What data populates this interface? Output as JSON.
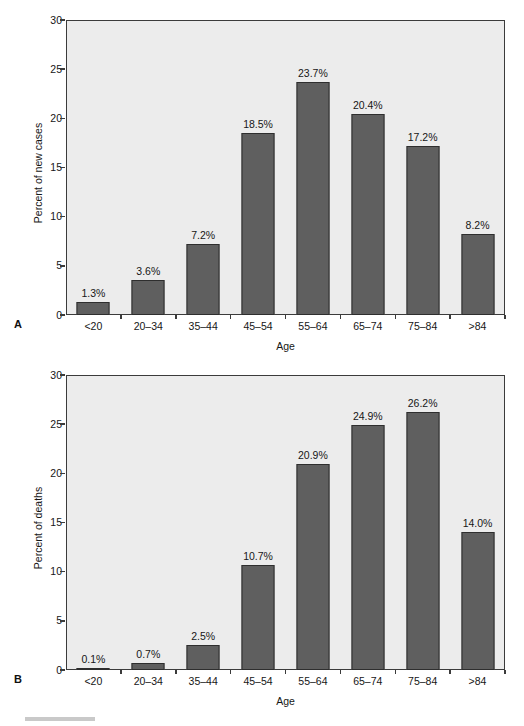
{
  "page": {
    "background": "#ffffff",
    "bar_color": "#5f5f5f",
    "plot_background": "#ececec",
    "axis_color": "#3b3b3b"
  },
  "panels": [
    {
      "letter": "A",
      "ylabel": "Percent of new cases",
      "xlabel": "Age",
      "yticks": [
        "0",
        "5",
        "10",
        "15",
        "20",
        "25",
        "30"
      ]
    },
    {
      "letter": "B",
      "ylabel": "Percent of deaths",
      "xlabel": "Age",
      "yticks": [
        "0",
        "5",
        "10",
        "15",
        "20",
        "25",
        "30"
      ]
    }
  ],
  "chart_data": [
    {
      "type": "bar",
      "panel": "A",
      "title": "",
      "xlabel": "Age",
      "ylabel": "Percent of new cases",
      "categories": [
        "<20",
        "20–34",
        "35–44",
        "45–54",
        "55–64",
        "65–74",
        "75–84",
        ">84"
      ],
      "values": [
        1.3,
        3.6,
        7.2,
        18.5,
        23.7,
        20.4,
        17.2,
        8.2
      ],
      "data_labels": [
        "1.3%",
        "3.6%",
        "7.2%",
        "18.5%",
        "23.7%",
        "20.4%",
        "17.2%",
        "8.2%"
      ],
      "ylim": [
        0,
        30
      ],
      "yticks": [
        0,
        5,
        10,
        15,
        20,
        25,
        30
      ],
      "ytick_labels": [
        "0",
        "5",
        "10",
        "15",
        "20",
        "25",
        "30"
      ],
      "grid": false,
      "legend": false
    },
    {
      "type": "bar",
      "panel": "B",
      "title": "",
      "xlabel": "Age",
      "ylabel": "Percent of deaths",
      "categories": [
        "<20",
        "20–34",
        "35–44",
        "45–54",
        "55–64",
        "65–74",
        "75–84",
        ">84"
      ],
      "values": [
        0.1,
        0.7,
        2.5,
        10.7,
        20.9,
        24.9,
        26.2,
        14.0
      ],
      "data_labels": [
        "0.1%",
        "0.7%",
        "2.5%",
        "10.7%",
        "20.9%",
        "24.9%",
        "26.2%",
        "14.0%"
      ],
      "ylim": [
        0,
        30
      ],
      "yticks": [
        0,
        5,
        10,
        15,
        20,
        25,
        30
      ],
      "ytick_labels": [
        "0",
        "5",
        "10",
        "15",
        "20",
        "25",
        "30"
      ],
      "grid": false,
      "legend": false
    }
  ]
}
